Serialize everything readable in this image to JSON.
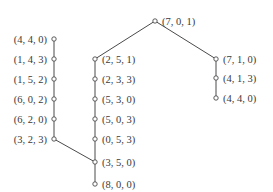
{
  "diagram": {
    "type": "state-tree",
    "colors": {
      "line": "#4a4a4a",
      "text": "#3a3a3a",
      "background": "#ffffff"
    },
    "nodes": [
      {
        "id": "n701",
        "label": "(7, 0, 1)",
        "x": 155,
        "y": 21,
        "label_side": "right"
      },
      {
        "id": "nL1",
        "label": "(4, 4, 0)",
        "x": 54,
        "y": 39,
        "label_side": "left"
      },
      {
        "id": "nL2",
        "label": "(1, 4, 3)",
        "x": 54,
        "y": 59,
        "label_side": "left"
      },
      {
        "id": "nL3",
        "label": "(1, 5, 2)",
        "x": 54,
        "y": 79,
        "label_side": "left"
      },
      {
        "id": "nL4",
        "label": "(6, 0, 2)",
        "x": 54,
        "y": 99,
        "label_side": "left"
      },
      {
        "id": "nL5",
        "label": "(6, 2, 0)",
        "x": 54,
        "y": 119,
        "label_side": "left"
      },
      {
        "id": "nL6",
        "label": "(3, 2, 3)",
        "x": 54,
        "y": 139,
        "label_side": "left"
      },
      {
        "id": "nM1",
        "label": "(2, 5, 1)",
        "x": 95,
        "y": 59,
        "label_side": "right"
      },
      {
        "id": "nM2",
        "label": "(2, 3, 3)",
        "x": 95,
        "y": 79,
        "label_side": "right"
      },
      {
        "id": "nM3",
        "label": "(5, 3, 0)",
        "x": 95,
        "y": 99,
        "label_side": "right"
      },
      {
        "id": "nM4",
        "label": "(5, 0, 3)",
        "x": 95,
        "y": 119,
        "label_side": "right"
      },
      {
        "id": "nM5",
        "label": "(0, 5, 3)",
        "x": 95,
        "y": 139,
        "label_side": "right"
      },
      {
        "id": "nM6",
        "label": "(3, 5, 0)",
        "x": 95,
        "y": 162,
        "label_side": "right"
      },
      {
        "id": "nM7",
        "label": "(8, 0, 0)",
        "x": 95,
        "y": 184,
        "label_side": "right"
      },
      {
        "id": "nR1",
        "label": "(7, 1, 0)",
        "x": 216,
        "y": 59,
        "label_side": "right"
      },
      {
        "id": "nR2",
        "label": "(4, 1, 3)",
        "x": 216,
        "y": 78,
        "label_side": "right"
      },
      {
        "id": "nR3",
        "label": "(4, 4, 0)",
        "x": 216,
        "y": 98,
        "label_side": "right"
      }
    ],
    "edges": [
      [
        "n701",
        "nM1"
      ],
      [
        "n701",
        "nR1"
      ],
      [
        "nM1",
        "nM2"
      ],
      [
        "nM2",
        "nM3"
      ],
      [
        "nM3",
        "nM4"
      ],
      [
        "nM4",
        "nM5"
      ],
      [
        "nM5",
        "nM6"
      ],
      [
        "nM6",
        "nM7"
      ],
      [
        "nR1",
        "nR2"
      ],
      [
        "nR2",
        "nR3"
      ],
      [
        "nL1",
        "nL2"
      ],
      [
        "nL2",
        "nL3"
      ],
      [
        "nL3",
        "nL4"
      ],
      [
        "nL4",
        "nL5"
      ],
      [
        "nL5",
        "nL6"
      ],
      [
        "nL6",
        "nM6"
      ]
    ]
  }
}
